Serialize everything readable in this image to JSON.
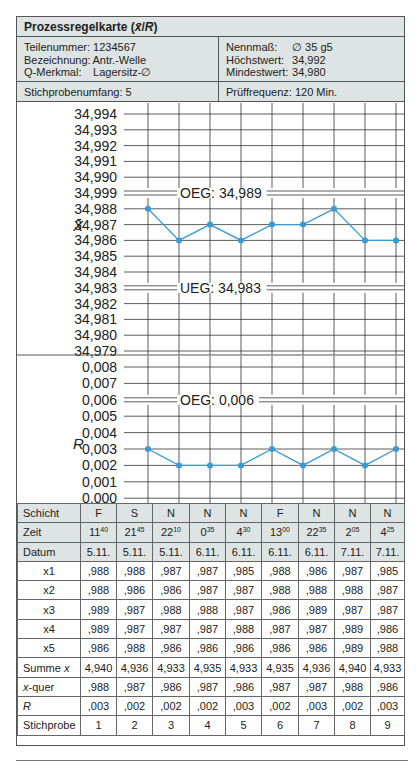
{
  "card": {
    "title": "Prozessregelkarte (x̄/R)",
    "title_main": "Prozessregelkarte (",
    "title_xbar": "x̄",
    "title_sep": "/",
    "title_r": "R",
    "title_end": ")"
  },
  "info": {
    "left": [
      {
        "key": "Teilenummer:",
        "value": "1234567"
      },
      {
        "key": "Bezeichnung:",
        "value": "Antr.-Welle"
      },
      {
        "key": "Q-Merkmal:",
        "value": "Lagersitz-∅"
      }
    ],
    "right": [
      {
        "key": "Nennmaß:",
        "value": "∅ 35 g5"
      },
      {
        "key": "Höchstwert:",
        "value": "34,992"
      },
      {
        "key": "Mindestwert:",
        "value": "34,980"
      }
    ],
    "sample_size": "Stichprobenumfang: 5",
    "test_frequency": "Prüffrequenz: 120 Min."
  },
  "colors": {
    "header_fill": "#dde4e3",
    "line": "#3a9ad6",
    "grid": "#333333"
  },
  "chart_data": [
    {
      "type": "line",
      "title": "x̄-Karte",
      "ylabel": "X̄",
      "y_tick_labels": [
        "34,994",
        "34,993",
        "34,992",
        "34,991",
        "34,990",
        "34,999",
        "34,988",
        "34,987",
        "34,986",
        "34,985",
        "34,984",
        "34,983",
        "34,982",
        "34,981",
        "34,980",
        "34,979"
      ],
      "x": [
        1,
        2,
        3,
        4,
        5,
        6,
        7,
        8,
        9
      ],
      "values": [
        34.988,
        34.986,
        34.987,
        34.986,
        34.987,
        34.987,
        34.988,
        34.986,
        34.986
      ],
      "value_labels_plotted": [
        "34,988",
        "34,986",
        "34,987",
        "34,986",
        "34,987",
        "34,987",
        "34,988",
        "34,986"
      ],
      "control_limits": [
        {
          "name": "OEG",
          "label": "OEG: 34,989",
          "value": 34.989
        },
        {
          "name": "UEG",
          "label": "UEG: 34,983",
          "value": 34.983
        }
      ],
      "grid": true
    },
    {
      "type": "line",
      "title": "R-Karte",
      "ylabel": "R",
      "y_tick_labels": [
        "0,008",
        "0,007",
        "0,006",
        "0,005",
        "0,004",
        "0,003",
        "0,002",
        "0,001",
        "0,000"
      ],
      "x": [
        1,
        2,
        3,
        4,
        5,
        6,
        7,
        8,
        9
      ],
      "values": [
        0.003,
        0.002,
        0.002,
        0.002,
        0.003,
        0.002,
        0.003,
        0.002,
        0.003
      ],
      "control_limits": [
        {
          "name": "OEG",
          "label": "OEG: 0,006",
          "value": 0.006
        }
      ],
      "grid": true
    }
  ],
  "table": {
    "rows": [
      {
        "label": "Schicht",
        "cells": [
          "F",
          "S",
          "N",
          "N",
          "N",
          "F",
          "N",
          "N",
          "N"
        ]
      },
      {
        "label": "Zeit",
        "cells": [
          [
            "11",
            "40"
          ],
          [
            "21",
            "45"
          ],
          [
            "22",
            "10"
          ],
          [
            "0",
            "35"
          ],
          [
            "4",
            "30"
          ],
          [
            "13",
            "00"
          ],
          [
            "22",
            "35"
          ],
          [
            "2",
            "05"
          ],
          [
            "4",
            "25"
          ]
        ]
      },
      {
        "label": "Datum",
        "cells": [
          "5.11.",
          "5.11.",
          "5.11.",
          "6.11.",
          "6.11.",
          "6.11.",
          "6.11.",
          "7.11.",
          "7.11."
        ]
      },
      {
        "label": "x1",
        "cells": [
          ",988",
          ",988",
          ",987",
          ",987",
          ",985",
          ",988",
          ",986",
          ",987",
          ",985"
        ]
      },
      {
        "label": "x2",
        "cells": [
          ",988",
          ",986",
          ",986",
          ",987",
          ",987",
          ",988",
          ",988",
          ",988",
          ",987"
        ]
      },
      {
        "label": "x3",
        "cells": [
          ",989",
          ",987",
          ",988",
          ",988",
          ",987",
          ",986",
          ",989",
          ",987",
          ",987"
        ]
      },
      {
        "label": "x4",
        "cells": [
          ",989",
          ",987",
          ",987",
          ",987",
          ",988",
          ",987",
          ",987",
          ",989",
          ",986"
        ]
      },
      {
        "label": "x5",
        "cells": [
          ",986",
          ",988",
          ",986",
          ",986",
          ",986",
          ",986",
          ",986",
          ",989",
          ",988"
        ]
      },
      {
        "label": "Summe x",
        "label_plain": "Summe ",
        "label_italic": "x",
        "cells": [
          "4,940",
          "4,936",
          "4,933",
          "4,935",
          "4,933",
          "4,935",
          "4,936",
          "4,940",
          "4,933"
        ]
      },
      {
        "label": "x-quer",
        "label_italic": "x",
        "label_plain": "-quer",
        "cells": [
          ",988",
          ",987",
          ",986",
          ",987",
          ",986",
          ",987",
          ",987",
          ",988",
          ",986"
        ]
      },
      {
        "label": "R",
        "cells": [
          ",003",
          ",002",
          ",002",
          ",002",
          ",003",
          ",002",
          ",003",
          ",002",
          ",003"
        ]
      },
      {
        "label": "Stichprobe",
        "cells": [
          "1",
          "2",
          "3",
          "4",
          "5",
          "6",
          "7",
          "8",
          "9"
        ]
      }
    ]
  }
}
